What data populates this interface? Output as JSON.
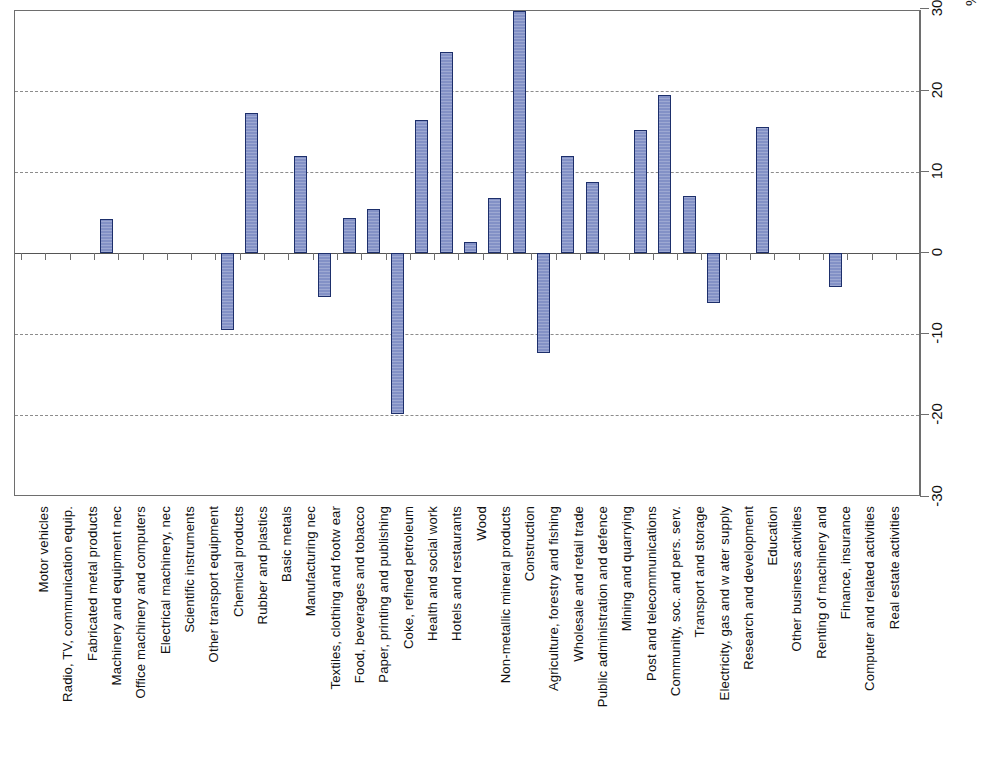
{
  "chart_data": {
    "type": "bar",
    "title": "",
    "subtitle": "",
    "xlabel": "",
    "ylabel": "%",
    "ylim": [
      -30,
      30
    ],
    "ytick_values": [
      30,
      20,
      10,
      0,
      -10,
      -20,
      -30
    ],
    "ytick_labels": [
      "30",
      "20",
      "10",
      "0",
      "-10",
      "-20",
      "-30"
    ],
    "gridlines_at": [
      20,
      10,
      -10,
      -20
    ],
    "zero_line": 0,
    "grid": true,
    "legend": "none",
    "axis_position": "right",
    "bar_color": "#8391c6",
    "bar_edge_color": "#1d2f6b",
    "categories": [
      "Motor vehicles",
      "Radio, TV, communication equip.",
      "Fabricated metal products",
      "Machinery and equipment nec",
      "Office machinery and computers",
      "Electrical machinery, nec",
      "Scientific instruments",
      "Other transport equipment",
      "Chemical products",
      "Rubber and plastics",
      "Basic metals",
      "Manufacturing nec",
      "Textiles, clothing and footw ear",
      "Food, beverages and tobacco",
      "Paper, printing and publishing",
      "Coke, refined petroleum",
      "Health and social work",
      "Hotels and restaurants",
      "Wood",
      "Non-metallic mineral products",
      "Construction",
      "Agriculture, forestry and fishing",
      "Wholesale and retail trade",
      "Public administration and defence",
      "Mining and quarrying",
      "Post and telecommunications",
      "Community, soc. and pers. serv.",
      "Transport and storage",
      "Electricity, gas and w ater supply",
      "Research and development",
      "Education",
      "Other business activities",
      "Renting of machinery and",
      "Finance, insurance",
      "Computer and related activities",
      "Real estate activities"
    ],
    "values": [
      0,
      0,
      0,
      4.2,
      0,
      0,
      0,
      0,
      -9.5,
      17.2,
      0,
      12.0,
      -5.4,
      4.3,
      5.4,
      -19.8,
      16.4,
      24.8,
      1.4,
      6.8,
      29.8,
      -12.3,
      12.0,
      8.8,
      0,
      15.2,
      19.5,
      7.0,
      -6.1,
      0,
      15.5,
      0,
      0,
      -4.2,
      0,
      0
    ]
  }
}
